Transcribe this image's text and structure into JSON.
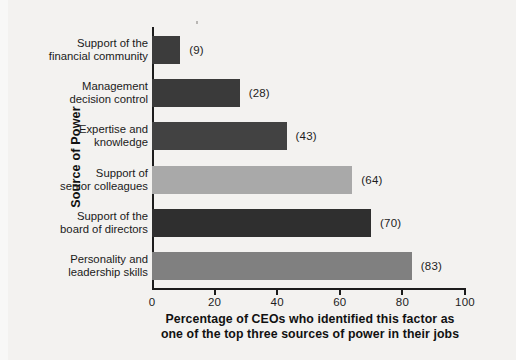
{
  "chart_data": {
    "type": "bar",
    "orientation": "horizontal",
    "title": "",
    "xlabel_line1": "Percentage of CEOs who identified this factor as",
    "xlabel_line2": "one of the top three sources of power in their jobs",
    "ylabel": "Source of Power",
    "categories": [
      "Support of the\nfinancial community",
      "Management\ndecision control",
      "Expertise and\nknowledge",
      "Support of\nsenior colleagues",
      "Support of the\nboard of directors",
      "Personality and\nleadership skills"
    ],
    "values": [
      9,
      28,
      43,
      64,
      70,
      83
    ],
    "value_labels": [
      "(9)",
      "(28)",
      "(43)",
      "(64)",
      "(70)",
      "(83)"
    ],
    "bar_colors": [
      "#3c3c3c",
      "#3a3a3a",
      "#424242",
      "#a9a9a9",
      "#2f2f2f",
      "#808080"
    ],
    "xlim": [
      0,
      100
    ],
    "xticks": [
      0,
      20,
      40,
      60,
      80,
      100
    ],
    "xticklabels": [
      "0",
      "20",
      "40",
      "60",
      "80",
      "100"
    ],
    "grid": false,
    "legend": "none",
    "background": "#f3f2f0",
    "axis_color": "#1c1c1c"
  }
}
